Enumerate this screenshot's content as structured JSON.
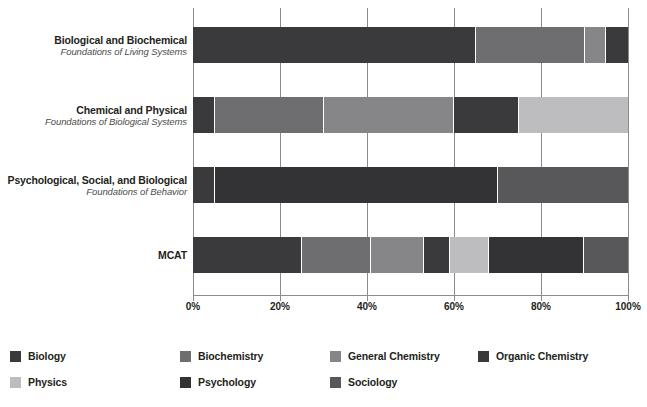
{
  "chart_data": {
    "type": "bar",
    "orientation": "horizontal",
    "stacked": true,
    "normalized": "percent",
    "title": "",
    "subtitle": "",
    "xlabel": "",
    "ylabel": "",
    "xlim": [
      0,
      100
    ],
    "xticks": [
      0,
      20,
      40,
      60,
      80,
      100
    ],
    "xtick_labels": [
      "0%",
      "20%",
      "40%",
      "60%",
      "80%",
      "100%"
    ],
    "grid": true,
    "grid_axis": "x",
    "legend_position": "bottom",
    "categories": [
      {
        "title": "Biological and Biochemical",
        "subtitle": "Foundations of Living Systems"
      },
      {
        "title": "Chemical and Physical",
        "subtitle": "Foundations of Biological Systems"
      },
      {
        "title": "Psychological, Social, and Biological",
        "subtitle": "Foundations of Behavior"
      },
      {
        "title": "MCAT",
        "subtitle": ""
      }
    ],
    "series": [
      {
        "name": "Biology",
        "color": "#3a3a3c",
        "values": [
          65,
          5,
          5,
          25
        ]
      },
      {
        "name": "Biochemistry",
        "color": "#6e6e70",
        "values": [
          25,
          25,
          0,
          16
        ]
      },
      {
        "name": "General Chemistry",
        "color": "#868688",
        "values": [
          5,
          30,
          0,
          12
        ]
      },
      {
        "name": "Organic Chemistry",
        "color": "#3a3a3c",
        "values": [
          5,
          15,
          0,
          6
        ]
      },
      {
        "name": "Physics",
        "color": "#bdbdbf",
        "values": [
          0,
          25,
          0,
          9
        ]
      },
      {
        "name": "Psychology",
        "color": "#333335",
        "values": [
          0,
          0,
          65,
          22
        ]
      },
      {
        "name": "Sociology",
        "color": "#58585a",
        "values": [
          0,
          0,
          30,
          10
        ]
      }
    ]
  },
  "legend": {
    "items": [
      {
        "label": "Biology",
        "color": "#3a3a3c"
      },
      {
        "label": "Biochemistry",
        "color": "#6e6e70"
      },
      {
        "label": "General Chemistry",
        "color": "#868688"
      },
      {
        "label": "Organic Chemistry",
        "color": "#3a3a3c"
      },
      {
        "label": "Physics",
        "color": "#bdbdbf"
      },
      {
        "label": "Psychology",
        "color": "#333335"
      },
      {
        "label": "Sociology",
        "color": "#58585a"
      }
    ]
  },
  "axis": {
    "tick_labels": [
      "0%",
      "20%",
      "40%",
      "60%",
      "80%",
      "100%"
    ]
  },
  "style": {
    "grid_color": "#8c8c8c",
    "text_color": "#231f20",
    "subtitle_color": "#4d4d4d",
    "background": "#ffffff"
  }
}
